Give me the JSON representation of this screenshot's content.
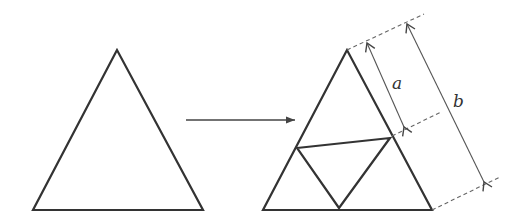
{
  "diagram": {
    "type": "geometry-transformation",
    "colors": {
      "stroke": "#333333",
      "thin": "#555555",
      "dashed": "#666666",
      "background": "#ffffff"
    },
    "left_triangle": {
      "points": [
        [
          117,
          50
        ],
        [
          33,
          210
        ],
        [
          203,
          210
        ]
      ]
    },
    "transform_arrow": {
      "from": [
        186,
        120
      ],
      "to": [
        295,
        120
      ]
    },
    "right_triangle": {
      "points": [
        [
          347,
          50
        ],
        [
          263,
          210
        ],
        [
          432,
          210
        ]
      ]
    },
    "inner_triangle": {
      "points": [
        [
          297,
          148
        ],
        [
          390,
          138
        ],
        [
          339,
          208
        ]
      ]
    },
    "dimensions": [
      {
        "label": "a",
        "from": [
          367,
          43
        ],
        "to": [
          404,
          127
        ]
      },
      {
        "label": "b",
        "from": [
          407,
          24
        ],
        "to": [
          483,
          182
        ]
      }
    ],
    "labels": {
      "a": "a",
      "b": "b"
    }
  }
}
